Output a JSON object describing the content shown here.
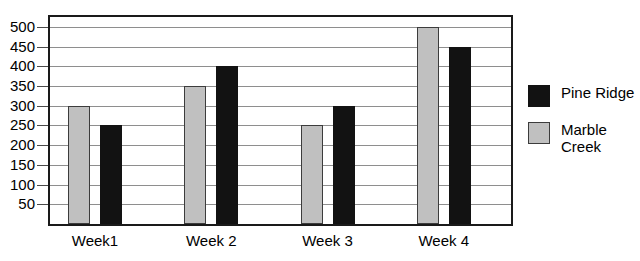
{
  "chart_data": {
    "type": "bar",
    "title": "",
    "xlabel": "",
    "ylabel": "",
    "categories": [
      "Week1",
      "Week 2",
      "Week 3",
      "Week 4"
    ],
    "series": [
      {
        "name": "Marble Creek",
        "color": "#c0c0c0",
        "values": [
          300,
          350,
          250,
          500
        ]
      },
      {
        "name": "Pine Ridge",
        "color": "#121212",
        "values": [
          250,
          400,
          300,
          450
        ]
      }
    ],
    "ylim": [
      0,
      525
    ],
    "yticks": [
      500,
      450,
      400,
      350,
      300,
      250,
      200,
      150,
      100,
      50
    ],
    "ytick_labels": [
      "500",
      "450",
      "400",
      "350",
      "300",
      "250",
      "200",
      "150",
      "100",
      "50"
    ],
    "grid": true,
    "legend_position": "right"
  },
  "axis": {
    "ticks": [
      {
        "label": "500",
        "value": 500
      },
      {
        "label": "450",
        "value": 450
      },
      {
        "label": "400",
        "value": 400
      },
      {
        "label": "350",
        "value": 350
      },
      {
        "label": "300",
        "value": 300
      },
      {
        "label": "250",
        "value": 250
      },
      {
        "label": "200",
        "value": 200
      },
      {
        "label": "150",
        "value": 150
      },
      {
        "label": "100",
        "value": 100
      },
      {
        "label": "50",
        "value": 50
      }
    ]
  },
  "categories": [
    {
      "label": "Week1",
      "marble": 300,
      "pine": 250
    },
    {
      "label": "Week 2",
      "marble": 350,
      "pine": 400
    },
    {
      "label": "Week 3",
      "marble": 250,
      "pine": 300
    },
    {
      "label": "Week 4",
      "marble": 500,
      "pine": 450
    }
  ],
  "legend": {
    "entries": [
      {
        "label": "Pine Ridge",
        "swatch": "pine",
        "color": "#121212"
      },
      {
        "label": "Marble\nCreek",
        "swatch": "marble",
        "color": "#c0c0c0"
      }
    ]
  },
  "title_remnant": ""
}
